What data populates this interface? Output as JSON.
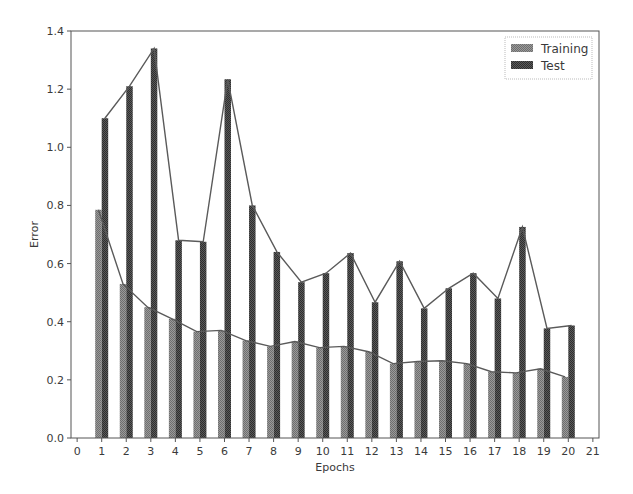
{
  "chart_data": {
    "type": "bar",
    "title": "",
    "xlabel": "Epochs",
    "ylabel": "Error",
    "xlim": [
      -0.25,
      21.25
    ],
    "ylim": [
      0.0,
      1.4
    ],
    "x_ticks": [
      0,
      1,
      2,
      3,
      4,
      5,
      6,
      7,
      8,
      9,
      10,
      11,
      12,
      13,
      14,
      15,
      16,
      17,
      18,
      19,
      20,
      21
    ],
    "y_ticks": [
      "0.0",
      "0.2",
      "0.4",
      "0.6",
      "0.8",
      "1.0",
      "1.2",
      "1.4"
    ],
    "grid": false,
    "legend_position": "upper right",
    "categories": [
      1,
      2,
      3,
      4,
      5,
      6,
      7,
      8,
      9,
      10,
      11,
      12,
      13,
      14,
      15,
      16,
      17,
      18,
      19,
      20
    ],
    "series": [
      {
        "name": "Training",
        "color": "#8c8c8c",
        "values": [
          0.785,
          0.53,
          0.45,
          0.41,
          0.366,
          0.37,
          0.335,
          0.315,
          0.332,
          0.311,
          0.315,
          0.297,
          0.256,
          0.263,
          0.266,
          0.256,
          0.228,
          0.224,
          0.238,
          0.21
        ]
      },
      {
        "name": "Test",
        "color": "#4a4a4a",
        "values": [
          1.1,
          1.21,
          1.34,
          0.68,
          0.675,
          1.234,
          0.8,
          0.64,
          0.536,
          0.567,
          0.636,
          0.467,
          0.608,
          0.446,
          0.515,
          0.567,
          0.48,
          0.726,
          0.377,
          0.387
        ]
      }
    ],
    "overlay": "line connecting bar tops for each series"
  },
  "legend": {
    "items": [
      {
        "label": "Training",
        "color": "#8c8c8c"
      },
      {
        "label": "Test",
        "color": "#4a4a4a"
      }
    ]
  },
  "axes": {
    "xlabel": "Epochs",
    "ylabel": "Error"
  }
}
